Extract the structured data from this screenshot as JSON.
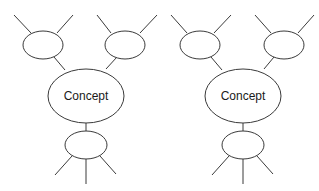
{
  "diagrams": [
    {
      "id": "left",
      "center_label": "Concept",
      "nodes": [
        "",
        "",
        ""
      ]
    },
    {
      "id": "right",
      "center_label": "Concept",
      "nodes": [
        "",
        "",
        ""
      ]
    }
  ],
  "colors": {
    "stroke": "#3a3a3a",
    "background": "#ffffff",
    "text": "#1a1a1a"
  }
}
